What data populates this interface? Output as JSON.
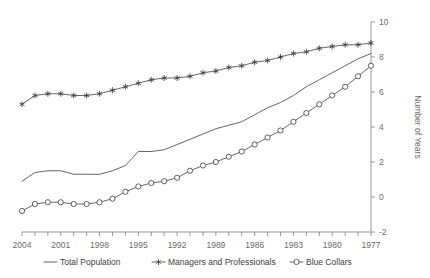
{
  "chart_data": {
    "type": "line",
    "title": "",
    "xlabel": "",
    "ylabel": "Number of Years",
    "xlim": [
      1977,
      2004
    ],
    "ylim": [
      -2,
      10
    ],
    "x_reversed": true,
    "grid": false,
    "legend_position": "bottom",
    "x_tick_labels": [
      "2004",
      "2001",
      "1998",
      "1995",
      "1992",
      "1989",
      "1986",
      "1983",
      "1980",
      "1977"
    ],
    "x_tick_values": [
      2004,
      2001,
      1998,
      1995,
      1992,
      1989,
      1986,
      1983,
      1980,
      1977
    ],
    "y_tick_labels": [
      "10",
      "8",
      "6",
      "4",
      "2",
      "0",
      "-2"
    ],
    "y_tick_values": [
      10,
      8,
      6,
      4,
      2,
      0,
      -2
    ],
    "x": [
      2004,
      2003,
      2002,
      2001,
      2000,
      1999,
      1998,
      1997,
      1996,
      1995,
      1994,
      1993,
      1992,
      1991,
      1990,
      1989,
      1988,
      1987,
      1986,
      1985,
      1984,
      1983,
      1982,
      1981,
      1980,
      1979,
      1978,
      1977
    ],
    "series": [
      {
        "name": "Total Population",
        "marker": "none",
        "values": [
          0.9,
          1.4,
          1.5,
          1.5,
          1.3,
          1.3,
          1.3,
          1.5,
          1.8,
          2.6,
          2.6,
          2.7,
          3.0,
          3.3,
          3.6,
          3.9,
          4.1,
          4.3,
          4.7,
          5.1,
          5.4,
          5.8,
          6.3,
          6.7,
          7.1,
          7.5,
          7.9,
          8.2
        ]
      },
      {
        "name": "Managers and Professionals",
        "marker": "star",
        "values": [
          5.3,
          5.8,
          5.9,
          5.9,
          5.8,
          5.8,
          5.9,
          6.1,
          6.3,
          6.5,
          6.7,
          6.8,
          6.8,
          6.9,
          7.1,
          7.2,
          7.4,
          7.5,
          7.7,
          7.8,
          8.0,
          8.2,
          8.3,
          8.5,
          8.6,
          8.7,
          8.7,
          8.8
        ]
      },
      {
        "name": "Blue Collars",
        "marker": "circle",
        "values": [
          -0.8,
          -0.4,
          -0.3,
          -0.3,
          -0.4,
          -0.4,
          -0.3,
          -0.1,
          0.3,
          0.6,
          0.8,
          0.9,
          1.1,
          1.5,
          1.8,
          2.0,
          2.3,
          2.6,
          3.0,
          3.4,
          3.8,
          4.3,
          4.8,
          5.3,
          5.8,
          6.3,
          6.9,
          7.5
        ]
      }
    ]
  },
  "legend": {
    "items": [
      {
        "label": "Total Population",
        "marker": "line"
      },
      {
        "label": "Managers and Professionals",
        "marker": "star"
      },
      {
        "label": "Blue Collars",
        "marker": "circle"
      }
    ]
  }
}
